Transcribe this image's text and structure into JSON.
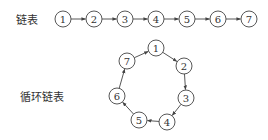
{
  "linear": {
    "label": "链表",
    "nodes": [
      {
        "value": "1",
        "x": 63,
        "y": 19
      },
      {
        "value": "2",
        "x": 94,
        "y": 19
      },
      {
        "value": "3",
        "x": 125,
        "y": 19
      },
      {
        "value": "4",
        "x": 156,
        "y": 19
      },
      {
        "value": "5",
        "x": 187,
        "y": 19
      },
      {
        "value": "6",
        "x": 218,
        "y": 19
      },
      {
        "value": "7",
        "x": 249,
        "y": 19
      }
    ]
  },
  "circular": {
    "label": "循环链表",
    "nodes": [
      {
        "value": "1",
        "x": 156,
        "y": 48
      },
      {
        "value": "2",
        "x": 184,
        "y": 66
      },
      {
        "value": "3",
        "x": 186,
        "y": 98
      },
      {
        "value": "4",
        "x": 167,
        "y": 122
      },
      {
        "value": "5",
        "x": 139,
        "y": 120
      },
      {
        "value": "6",
        "x": 117,
        "y": 96
      },
      {
        "value": "7",
        "x": 127,
        "y": 61
      }
    ]
  },
  "style": {
    "stroke": "#444444",
    "text": "#333333",
    "radius": 8
  }
}
